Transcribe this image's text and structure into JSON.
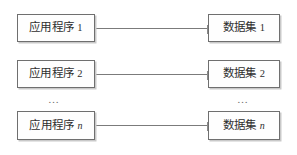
{
  "diagram": {
    "type": "paired-nodes",
    "background_color": "#ffffff",
    "border_color": "#6f6f6f",
    "text_color": "#2e2e2e",
    "connector_color": "#7b7b7b",
    "rows": [
      {
        "left": {
          "name": "应用程序",
          "index": "1",
          "index_is_variable": false
        },
        "right": {
          "name": "数据集",
          "index": "1",
          "index_is_variable": false
        }
      },
      {
        "left": {
          "name": "应用程序",
          "index": "2",
          "index_is_variable": false
        },
        "right": {
          "name": "数据集",
          "index": "2",
          "index_is_variable": false
        }
      },
      {
        "left": {
          "name": "应用程序",
          "index": "n",
          "index_is_variable": true
        },
        "right": {
          "name": "数据集",
          "index": "n",
          "index_is_variable": true
        }
      }
    ],
    "ellipsis": {
      "left": "…",
      "right": "…"
    }
  }
}
